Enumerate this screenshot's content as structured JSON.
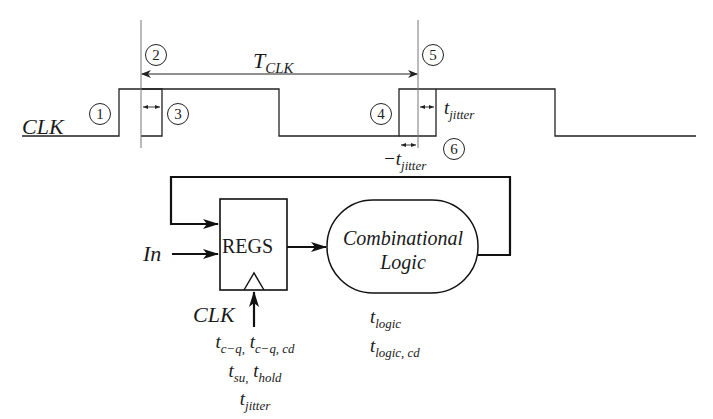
{
  "timing": {
    "signal_label": "CLK",
    "period_label_main": "T",
    "period_label_sub": "CLK",
    "jitter_label_main": "t",
    "jitter_label_sub": "jitter",
    "neg_jitter_label_main": "−t",
    "neg_jitter_label_sub": "jitter",
    "markers": [
      "1",
      "2",
      "3",
      "4",
      "5",
      "6"
    ]
  },
  "circuit": {
    "input_label": "In",
    "register_label": "REGS",
    "clock_label": "CLK",
    "logic_label_line1": "Combinational",
    "logic_label_line2": "Logic",
    "register_params": {
      "line1": [
        {
          "main": "t",
          "sub": "c−q,"
        },
        {
          "main": "t",
          "sub": "c−q, cd"
        }
      ],
      "line2": [
        {
          "main": "t",
          "sub": "su,"
        },
        {
          "main": "t",
          "sub": "hold"
        }
      ],
      "line3": [
        {
          "main": "t",
          "sub": "jitter"
        }
      ]
    },
    "logic_params": {
      "line1": {
        "main": "t",
        "sub": "logic"
      },
      "line2": {
        "main": "t",
        "sub": "logic, cd"
      }
    }
  },
  "colors": {
    "stroke": "#222222",
    "guide": "#888888",
    "background": "#ffffff"
  }
}
